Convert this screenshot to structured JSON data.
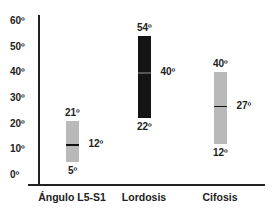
{
  "chart_data": {
    "type": "range-bar",
    "title": "",
    "xlabel": "",
    "ylabel": "",
    "ylim": [
      0,
      60
    ],
    "yticks": [
      "0º",
      "10º",
      "20º",
      "30º",
      "40º",
      "50º",
      "60º"
    ],
    "categories": [
      "Ángulo L5-S1",
      "Lordosis",
      "Cifosis"
    ],
    "series": [
      {
        "name": "Ángulo L5-S1",
        "min": 5,
        "max": 21,
        "median": 12,
        "color": "#b9b9b9",
        "labels": {
          "max": "21º",
          "min": "5º",
          "median": "12º"
        }
      },
      {
        "name": "Lordosis",
        "min": 22,
        "max": 54,
        "median": 40,
        "color": "#141414",
        "labels": {
          "max": "54º",
          "min": "22º",
          "median": "40º"
        }
      },
      {
        "name": "Cifosis",
        "min": 12,
        "max": 40,
        "median": 27,
        "color": "#b9b9b9",
        "labels": {
          "max": "40º",
          "min": "12º",
          "median": "27º"
        }
      }
    ],
    "grid": false,
    "legend": "none"
  }
}
